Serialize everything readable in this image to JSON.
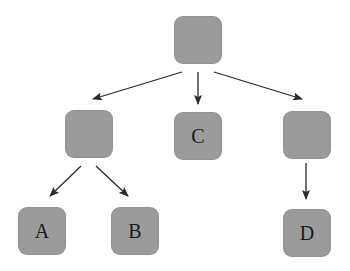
{
  "diagram": {
    "type": "tree",
    "colors": {
      "node_fill": "#9b9b9b",
      "edge": "#2a2a2a",
      "label": "#1a1a1a",
      "background": "#ffffff"
    },
    "nodes": [
      {
        "id": "root",
        "label": "",
        "x": 174,
        "y": 16
      },
      {
        "id": "left",
        "label": "",
        "x": 65,
        "y": 110
      },
      {
        "id": "c",
        "label": "C",
        "x": 174,
        "y": 112
      },
      {
        "id": "right",
        "label": "",
        "x": 283,
        "y": 111
      },
      {
        "id": "a",
        "label": "A",
        "x": 18,
        "y": 207
      },
      {
        "id": "b",
        "label": "B",
        "x": 111,
        "y": 207
      },
      {
        "id": "d",
        "label": "D",
        "x": 283,
        "y": 209
      }
    ],
    "edges": [
      {
        "from": "root",
        "to": "left",
        "x1": 182,
        "y1": 72,
        "x2": 93,
        "y2": 99
      },
      {
        "from": "root",
        "to": "c",
        "x1": 198,
        "y1": 72,
        "x2": 198,
        "y2": 104
      },
      {
        "from": "root",
        "to": "right",
        "x1": 214,
        "y1": 72,
        "x2": 302,
        "y2": 99
      },
      {
        "from": "left",
        "to": "a",
        "x1": 81,
        "y1": 166,
        "x2": 50,
        "y2": 196
      },
      {
        "from": "left",
        "to": "b",
        "x1": 96,
        "y1": 166,
        "x2": 128,
        "y2": 196
      },
      {
        "from": "right",
        "to": "d",
        "x1": 306,
        "y1": 163,
        "x2": 306,
        "y2": 199
      }
    ]
  }
}
